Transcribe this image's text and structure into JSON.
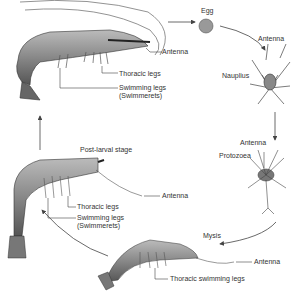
{
  "diagram": {
    "stages": [
      {
        "id": "adult",
        "labels": [
          "Antenna",
          "Thoracic legs",
          "Swimming legs",
          "(Swimmerets)"
        ]
      },
      {
        "id": "egg",
        "label": "Egg"
      },
      {
        "id": "nauplius",
        "label": "Nauplius",
        "labels": [
          "Antenna"
        ]
      },
      {
        "id": "protozoea",
        "label": "Protozoea",
        "labels": [
          "Antenna"
        ]
      },
      {
        "id": "mysis",
        "label": "Mysis",
        "labels": [
          "Antenna",
          "Thoracic swimming legs"
        ]
      },
      {
        "id": "post_larval",
        "label": "Post-larval stage",
        "labels": [
          "Antenna",
          "Thoracic legs",
          "Swimming legs",
          "(Swimmerets)"
        ]
      }
    ],
    "cycle_order": [
      "adult",
      "egg",
      "nauplius",
      "protozoea",
      "mysis",
      "post_larval",
      "adult"
    ],
    "colors": {
      "line": "#444444",
      "body": "#8a8a8a",
      "text": "#333333"
    }
  }
}
